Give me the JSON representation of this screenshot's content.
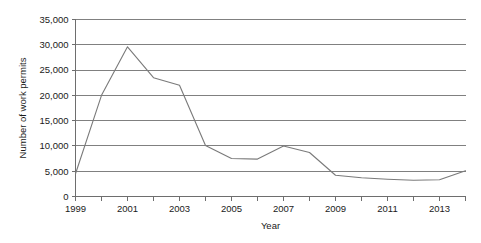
{
  "chart_data": {
    "type": "line",
    "title": "",
    "xlabel": "Year",
    "ylabel": "Number of work permits",
    "x": [
      1999,
      2000,
      2001,
      2002,
      2003,
      2004,
      2005,
      2006,
      2007,
      2008,
      2009,
      2010,
      2011,
      2012,
      2013,
      2014
    ],
    "values": [
      4500,
      20000,
      29600,
      23500,
      22000,
      10100,
      7500,
      7400,
      10000,
      8700,
      4200,
      3700,
      3400,
      3200,
      3300,
      5100
    ],
    "series": [
      {
        "name": "Number of work permits",
        "values": [
          4500,
          20000,
          29600,
          23500,
          22000,
          10100,
          7500,
          7400,
          10000,
          8700,
          4200,
          3700,
          3400,
          3200,
          3300,
          5100
        ]
      }
    ],
    "xlim": [
      1999,
      2014
    ],
    "ylim": [
      0,
      35000
    ],
    "x_tick_labels": [
      "1999",
      "2001",
      "2003",
      "2005",
      "2007",
      "2009",
      "2011",
      "2013"
    ],
    "x_tick_values": [
      1999,
      2001,
      2003,
      2005,
      2007,
      2009,
      2011,
      2013
    ],
    "y_tick_labels": [
      "0",
      "5,000",
      "10,000",
      "15,000",
      "20,000",
      "25,000",
      "30,000",
      "35,000"
    ],
    "y_tick_values": [
      0,
      5000,
      10000,
      15000,
      20000,
      25000,
      30000,
      35000
    ],
    "grid": true,
    "grid_axis": "y",
    "legend": false,
    "legend_position": "none",
    "line_color": "#7a7a7a",
    "grid_color": "#808080",
    "axis_color": "#6e6e6e",
    "text_color": "#1a1a1a",
    "background_color": "#ffffff"
  }
}
